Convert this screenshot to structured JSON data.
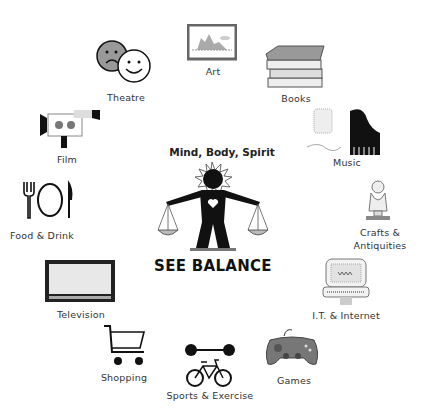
{
  "center": {
    "title": "Mind, Body, Spirit",
    "footer": "SEE BALANCE",
    "icon": "balance-scale-person-icon"
  },
  "categories": [
    {
      "label": "Art",
      "icon": "framed-painting-icon"
    },
    {
      "label": "Books",
      "icon": "book-stack-icon"
    },
    {
      "label": "Music",
      "icon": "piano-speaker-icon"
    },
    {
      "label": "Crafts &",
      "label2": "Antiquities",
      "icon": "bust-statue-icon"
    },
    {
      "label": "I.T. & Internet",
      "icon": "computer-icon"
    },
    {
      "label": "Games",
      "icon": "gamepad-icon"
    },
    {
      "label": "Sports & Exercise",
      "icon": "dumbbell-bicycle-icon"
    },
    {
      "label": "Shopping",
      "icon": "shopping-cart-icon"
    },
    {
      "label": "Television",
      "icon": "television-icon"
    },
    {
      "label": "Food & Drink",
      "icon": "fork-plate-knife-icon"
    },
    {
      "label": "Film",
      "icon": "film-camera-icon"
    },
    {
      "label": "Theatre",
      "icon": "theatre-masks-icon"
    }
  ]
}
